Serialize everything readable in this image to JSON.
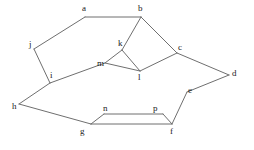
{
  "diagram": {
    "type": "graph",
    "canvas": {
      "width": 254,
      "height": 150,
      "background": "#ffffff"
    },
    "style": {
      "edge_color": "#6f6f6f",
      "edge_width": 1,
      "label_color": "#1a1a1a",
      "label_font_size": 9
    },
    "vertices": [
      {
        "id": "a",
        "label": "a",
        "x": 85,
        "y": 17,
        "label_x": 82,
        "label_y": 4
      },
      {
        "id": "b",
        "label": "b",
        "x": 141,
        "y": 17,
        "label_x": 138,
        "label_y": 4
      },
      {
        "id": "c",
        "label": "c",
        "x": 177,
        "y": 53,
        "label_x": 178,
        "label_y": 43
      },
      {
        "id": "d",
        "label": "d",
        "x": 229,
        "y": 75,
        "label_x": 232,
        "label_y": 69
      },
      {
        "id": "e",
        "label": "e",
        "x": 187,
        "y": 92,
        "label_x": 188,
        "label_y": 86
      },
      {
        "id": "f",
        "label": "f",
        "x": 172,
        "y": 124,
        "label_x": 170,
        "label_y": 127
      },
      {
        "id": "g",
        "label": "g",
        "x": 91,
        "y": 124,
        "label_x": 80,
        "label_y": 127
      },
      {
        "id": "h",
        "label": "h",
        "x": 19,
        "y": 104,
        "label_x": 12,
        "label_y": 102
      },
      {
        "id": "i",
        "label": "i",
        "x": 50,
        "y": 83,
        "label_x": 50,
        "label_y": 71
      },
      {
        "id": "j",
        "label": "j",
        "x": 34,
        "y": 49,
        "label_x": 29,
        "label_y": 40
      },
      {
        "id": "k",
        "label": "k",
        "x": 122,
        "y": 50,
        "label_x": 118,
        "label_y": 39
      },
      {
        "id": "l",
        "label": "l",
        "x": 140,
        "y": 71,
        "label_x": 138,
        "label_y": 73
      },
      {
        "id": "m",
        "label": "m",
        "x": 105,
        "y": 63,
        "label_x": 97,
        "label_y": 59
      },
      {
        "id": "n",
        "label": "n",
        "x": 104,
        "y": 114,
        "label_x": 103,
        "label_y": 104
      },
      {
        "id": "p",
        "label": "p",
        "x": 163,
        "y": 114,
        "label_x": 153,
        "label_y": 104
      }
    ],
    "edges": [
      {
        "from": "a",
        "to": "b"
      },
      {
        "from": "a",
        "to": "j"
      },
      {
        "from": "b",
        "to": "k"
      },
      {
        "from": "b",
        "to": "c"
      },
      {
        "from": "j",
        "to": "i"
      },
      {
        "from": "i",
        "to": "m"
      },
      {
        "from": "i",
        "to": "h"
      },
      {
        "from": "k",
        "to": "m"
      },
      {
        "from": "k",
        "to": "l"
      },
      {
        "from": "m",
        "to": "l"
      },
      {
        "from": "l",
        "to": "c"
      },
      {
        "from": "c",
        "to": "d"
      },
      {
        "from": "d",
        "to": "e"
      },
      {
        "from": "e",
        "to": "f"
      },
      {
        "from": "h",
        "to": "g"
      },
      {
        "from": "g",
        "to": "n"
      },
      {
        "from": "g",
        "to": "f"
      },
      {
        "from": "n",
        "to": "p"
      },
      {
        "from": "p",
        "to": "f"
      }
    ]
  }
}
